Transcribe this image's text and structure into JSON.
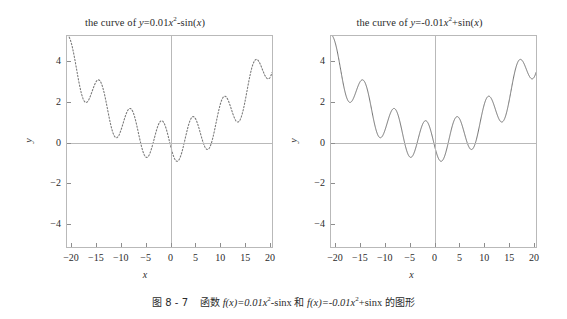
{
  "figure": {
    "caption_prefix": "图 8 - 7",
    "caption_body_cn_1": "函数",
    "caption_fx1": "f(x)=0.01x",
    "caption_fx1_sup": "2",
    "caption_fx1_tail": "-sinx",
    "caption_and": "和",
    "caption_fx2": "f(x)=-0.01x",
    "caption_fx2_sup": "2",
    "caption_fx2_tail": "+sinx",
    "caption_body_cn_2": "的图形"
  },
  "panels": [
    {
      "id": "left",
      "title_prefix": "the curve of ",
      "title_y": "y",
      "title_eq": "=0.01",
      "title_var": "x",
      "title_sup": "2",
      "title_tail_op": "-sin(",
      "title_tail_var": "x",
      "title_tail_close": ")",
      "xlabel": "x",
      "ylabel": "y",
      "line_style": "dashed",
      "line_color": "#7a7a7a"
    },
    {
      "id": "right",
      "title_prefix": "the curve of ",
      "title_y": "y",
      "title_eq": "=-0.01",
      "title_var": "x",
      "title_sup": "2",
      "title_tail_op": "+sin(",
      "title_tail_var": "x",
      "title_tail_close": ")",
      "xlabel": "x",
      "ylabel": "y",
      "line_style": "solid",
      "line_color": "#6f6f6f"
    }
  ],
  "chart_data": [
    {
      "type": "line",
      "id": "left-plot",
      "title": "the curve of y=0.01x^2-sin(x)",
      "xlabel": "x",
      "ylabel": "y",
      "xlim": [
        -20.8,
        20.8
      ],
      "ylim": [
        -5.2,
        5.2
      ],
      "xticks": [
        -20,
        -15,
        -10,
        -5,
        0,
        5,
        10,
        15,
        20
      ],
      "xtick_labels": [
        "-20",
        "-15",
        "-10",
        "-5",
        "0",
        "5",
        "10",
        "15",
        "20"
      ],
      "yticks": [
        -4,
        -2,
        0,
        2,
        4
      ],
      "ytick_labels": [
        "-4",
        "-2",
        "0",
        "2",
        "4"
      ],
      "grid": false,
      "legend": "none",
      "linestyle": "dashed",
      "color": "#7a7a7a",
      "formula": "y = 0.01*x^2 - sin(x)",
      "series": [
        {
          "name": "0.01x^2 - sin(x)",
          "x": [
            -20,
            -19.5,
            -19,
            -18.5,
            -18,
            -17.5,
            -17,
            -16.5,
            -16,
            -15.5,
            -15,
            -14.5,
            -14,
            -13.5,
            -13,
            -12.5,
            -12,
            -11.5,
            -11,
            -10.5,
            -10,
            -9.5,
            -9,
            -8.5,
            -8,
            -7.5,
            -7,
            -6.5,
            -6,
            -5.5,
            -5,
            -4.5,
            -4,
            -3.5,
            -3,
            -2.5,
            -2,
            -1.5,
            -1,
            -0.5,
            0,
            0.5,
            1,
            1.5,
            2,
            2.5,
            3,
            3.5,
            4,
            4.5,
            5,
            5.5,
            6,
            6.5,
            7,
            7.5,
            8,
            8.5,
            9,
            9.5,
            10,
            10.5,
            11,
            11.5,
            12,
            12.5,
            13,
            13.5,
            14,
            14.5,
            15,
            15.5,
            16,
            16.5,
            17,
            17.5,
            18,
            18.5,
            19,
            19.5,
            20
          ],
          "y": [
            4.91,
            4.49,
            3.76,
            2.85,
            2.0,
            1.45,
            1.35,
            1.43,
            1.27,
            2.14,
            2.9,
            2.92,
            2.95,
            2.61,
            2.11,
            1.5,
            2.04,
            2.31,
            2.21,
            1.98,
            1.54,
            1.978,
            1.22,
            0.0,
            0.35,
            0.62,
            0.15,
            -0.2,
            0.64,
            1.01,
            0.71,
            1.18,
            0.92,
            0.48,
            0.23,
            -0.02,
            -0.87,
            -0.98,
            -0.83,
            -0.23,
            0.0,
            -0.48,
            -0.84,
            -1.0,
            -0.87,
            -0.54,
            -0.05,
            0.47,
            0.92,
            1.18,
            1.21,
            1.02,
            0.64,
            0.21,
            -0.16,
            -0.38,
            -0.35,
            -0.07,
            0.4,
            0.98,
            1.54,
            1.98,
            2.21,
            2.31,
            2.04,
            1.5,
            2.11,
            2.61,
            2.95,
            2.92,
            2.9,
            2.14,
            1.27,
            1.43,
            1.35,
            1.45,
            2.0,
            2.85,
            3.76,
            4.49,
            4.91
          ]
        }
      ]
    },
    {
      "type": "line",
      "id": "right-plot",
      "title": "the curve of y=-0.01x^2+sin(x)",
      "xlabel": "x",
      "ylabel": "y",
      "xlim": [
        -20.8,
        20.8
      ],
      "ylim": [
        -5.2,
        5.2
      ],
      "xticks": [
        -20,
        -15,
        -10,
        -5,
        0,
        5,
        10,
        15,
        20
      ],
      "xtick_labels": [
        "-20",
        "-15",
        "-10",
        "-5",
        "0",
        "5",
        "10",
        "15",
        "20"
      ],
      "yticks": [
        -4,
        -2,
        0,
        2,
        4
      ],
      "ytick_labels": [
        "-4",
        "-2",
        "0",
        "2",
        "4"
      ],
      "grid": false,
      "legend": "none",
      "linestyle": "solid",
      "color": "#6f6f6f",
      "formula": "y = -0.01*x^2 + sin(x)",
      "series": [
        {
          "name": "-0.01x^2 + sin(x)",
          "x": [
            -20,
            -19.5,
            -19,
            -18.5,
            -18,
            -17.5,
            -17,
            -16.5,
            -16,
            -15.5,
            -15,
            -14.5,
            -14,
            -13.5,
            -13,
            -12.5,
            -12,
            -11.5,
            -11,
            -10.5,
            -10,
            -9.5,
            -9,
            -8.5,
            -8,
            -7.5,
            -7,
            -6.5,
            -6,
            -5.5,
            -5,
            -4.5,
            -4,
            -3.5,
            -3,
            -2.5,
            -2,
            -1.5,
            -1,
            -0.5,
            0,
            0.5,
            1,
            1.5,
            2,
            2.5,
            3,
            3.5,
            4,
            4.5,
            5,
            5.5,
            6,
            6.5,
            7,
            7.5,
            8,
            8.5,
            9,
            9.5,
            10,
            10.5,
            11,
            11.5,
            12,
            12.5,
            13,
            13.5,
            14,
            14.5,
            15,
            15.5,
            16,
            16.5,
            17,
            17.5,
            18,
            18.5,
            19,
            19.5,
            20
          ],
          "y": [
            -4.91,
            -4.49,
            -3.76,
            -2.85,
            -2.0,
            -1.45,
            -1.35,
            -1.43,
            -1.27,
            -2.14,
            -2.9,
            -2.92,
            -2.95,
            -2.61,
            -2.11,
            -1.5,
            -2.04,
            -2.31,
            -2.21,
            -1.98,
            -1.54,
            -1.198,
            -1.22,
            -0.28,
            -0.35,
            -0.62,
            -0.15,
            0.2,
            -0.64,
            -1.01,
            -0.71,
            -1.18,
            -0.92,
            -0.48,
            -0.23,
            0.02,
            0.87,
            0.98,
            0.83,
            0.23,
            0.0,
            0.48,
            0.84,
            1.0,
            0.87,
            0.54,
            0.05,
            -0.47,
            -0.92,
            -1.18,
            -1.21,
            -1.02,
            -0.64,
            -0.21,
            0.16,
            0.38,
            0.35,
            0.07,
            -0.4,
            -0.98,
            -1.54,
            -1.98,
            -2.21,
            -2.31,
            -2.04,
            -1.5,
            -2.11,
            -2.61,
            -2.95,
            -2.92,
            -2.9,
            -2.14,
            -1.27,
            -1.43,
            -1.35,
            -1.45,
            -2.0,
            -2.85,
            -3.76,
            -4.49,
            -4.91
          ]
        }
      ]
    }
  ]
}
